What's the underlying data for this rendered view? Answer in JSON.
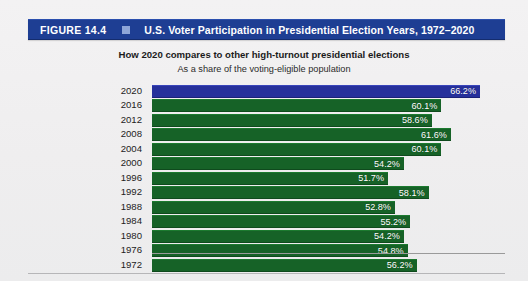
{
  "header": {
    "figure_number": "FIGURE 14.4",
    "bullet_icon": "square-bullet-icon",
    "title": "U.S. Voter Participation in Presidential Election Years, 1972–2020",
    "bar_color": "#1e3e93",
    "bullet_color": "#8fa6d8"
  },
  "subtitle_primary": "How 2020 compares to other high-turnout presidential elections",
  "subtitle_secondary": "As a share of the voting-eligible population",
  "colors": {
    "bar_default": "#166227",
    "bar_highlight": "#26309b",
    "background": "#f1f0f1",
    "axis": "#9a9a9a"
  },
  "chart_data": {
    "type": "bar",
    "orientation": "horizontal",
    "title": "U.S. Voter Participation in Presidential Election Years, 1972–2020",
    "subtitle": "How 2020 compares to other high-turnout presidential elections",
    "subtitle2": "As a share of the voting-eligible population",
    "xlabel": "",
    "ylabel": "",
    "xlim": [
      0,
      70
    ],
    "grid": false,
    "legend": false,
    "value_suffix": "%",
    "highlight_category": "2020",
    "categories": [
      "2020",
      "2016",
      "2012",
      "2008",
      "2004",
      "2000",
      "1996",
      "1992",
      "1988",
      "1984",
      "1980",
      "1976",
      "1972"
    ],
    "values": [
      66.2,
      60.1,
      58.6,
      61.6,
      60.1,
      54.2,
      51.7,
      58.1,
      52.8,
      55.2,
      54.2,
      54.8,
      56.2
    ],
    "bars": [
      {
        "year": "2020",
        "value": 66.2,
        "label": "66.2%",
        "highlight": true
      },
      {
        "year": "2016",
        "value": 60.1,
        "label": "60.1%",
        "highlight": false
      },
      {
        "year": "2012",
        "value": 58.6,
        "label": "58.6%",
        "highlight": false
      },
      {
        "year": "2008",
        "value": 61.6,
        "label": "61.6%",
        "highlight": false
      },
      {
        "year": "2004",
        "value": 60.1,
        "label": "60.1%",
        "highlight": false
      },
      {
        "year": "2000",
        "value": 54.2,
        "label": "54.2%",
        "highlight": false
      },
      {
        "year": "1996",
        "value": 51.7,
        "label": "51.7%",
        "highlight": false
      },
      {
        "year": "1992",
        "value": 58.1,
        "label": "58.1%",
        "highlight": false
      },
      {
        "year": "1988",
        "value": 52.8,
        "label": "52.8%",
        "highlight": false
      },
      {
        "year": "1984",
        "value": 55.2,
        "label": "55.2%",
        "highlight": false
      },
      {
        "year": "1980",
        "value": 54.2,
        "label": "54.2%",
        "highlight": false
      },
      {
        "year": "1976",
        "value": 54.8,
        "label": "54.8%",
        "highlight": false
      },
      {
        "year": "1972",
        "value": 56.2,
        "label": "56.2%",
        "highlight": false
      }
    ]
  }
}
